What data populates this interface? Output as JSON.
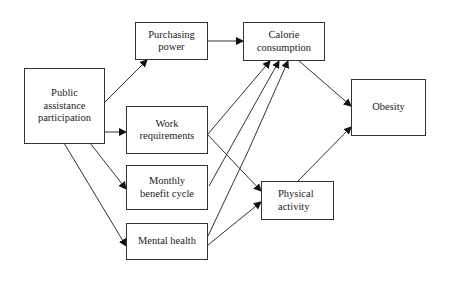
{
  "diagram": {
    "nodes": [
      {
        "id": "purchasing_power",
        "lines": [
          "Purchasing",
          "power"
        ]
      },
      {
        "id": "public_assistance",
        "lines": [
          "Public",
          "assistance",
          "participation"
        ]
      },
      {
        "id": "work_requirements",
        "lines": [
          "Work",
          "requirements"
        ]
      },
      {
        "id": "monthly_benefit",
        "lines": [
          "Monthly",
          "benefit cycle"
        ]
      },
      {
        "id": "mental_health",
        "lines": [
          "Mental health"
        ]
      },
      {
        "id": "calorie_consumption",
        "lines": [
          "Calorie",
          "consumption"
        ]
      },
      {
        "id": "obesity",
        "lines": [
          "Obesity"
        ]
      },
      {
        "id": "physical_activity",
        "lines": [
          "Physical",
          "activity"
        ]
      }
    ],
    "edges": [
      [
        "public_assistance",
        "purchasing_power"
      ],
      [
        "public_assistance",
        "work_requirements"
      ],
      [
        "public_assistance",
        "monthly_benefit"
      ],
      [
        "public_assistance",
        "mental_health"
      ],
      [
        "purchasing_power",
        "calorie_consumption"
      ],
      [
        "work_requirements",
        "calorie_consumption"
      ],
      [
        "monthly_benefit",
        "calorie_consumption"
      ],
      [
        "mental_health",
        "calorie_consumption"
      ],
      [
        "work_requirements",
        "physical_activity"
      ],
      [
        "mental_health",
        "physical_activity"
      ],
      [
        "calorie_consumption",
        "obesity"
      ],
      [
        "physical_activity",
        "obesity"
      ]
    ]
  }
}
